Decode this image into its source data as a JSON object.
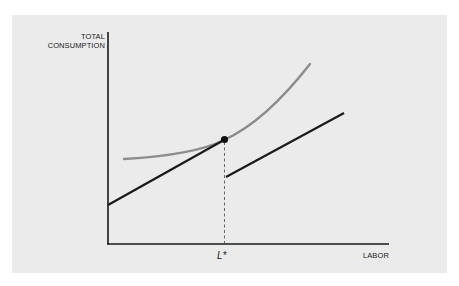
{
  "diagram": {
    "y_axis_label_line1": "TOTAL",
    "y_axis_label_line2": "CONSUMPTION",
    "x_axis_label": "LABOR",
    "x_marker_label": "L*",
    "colors": {
      "background": "#ebebeb",
      "axis": "#1a1a1a",
      "budget_line": "#1a1a1a",
      "indifference_curve": "#8c8c8c",
      "dashed_guide": "#444444"
    },
    "elements": [
      {
        "name": "budget-line-left",
        "type": "line",
        "from": [
          108,
          205
        ],
        "to": [
          224,
          140
        ]
      },
      {
        "name": "budget-line-right",
        "type": "line",
        "from": [
          226,
          177
        ],
        "to": [
          344,
          113
        ]
      },
      {
        "name": "indifference-curve",
        "type": "curve",
        "from": [
          124,
          159
        ],
        "via": [
          224,
          140
        ],
        "to": [
          310,
          64
        ]
      },
      {
        "name": "tangency-point",
        "type": "dot",
        "at": [
          224,
          140
        ]
      },
      {
        "name": "l-star-guide",
        "type": "dashed-line",
        "x": 224,
        "from_y": 140,
        "to_y": 244
      }
    ]
  }
}
